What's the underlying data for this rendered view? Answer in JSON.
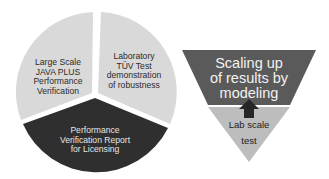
{
  "pie": {
    "segments": [
      {
        "label": "Laboratory TÜV Test demonstration of robustness",
        "lines": [
          "Laboratory",
          "TÜV Test",
          "demonstration",
          "of robustness"
        ],
        "color": "#d9d9d9"
      },
      {
        "label": "Performance Verification Report for Licensing",
        "lines": [
          "Performance",
          "Verification Report",
          "for Licensing"
        ],
        "color": "#2f2f2f"
      },
      {
        "label": "Large Scale JAVA PLUS Performance Verification",
        "lines": [
          "Large Scale",
          "JAVA PLUS",
          "Performance",
          "Verification"
        ],
        "color": "#d9d9d9"
      }
    ]
  },
  "funnel": {
    "top": {
      "lines": [
        "Scaling up",
        "of results by",
        "modeling"
      ],
      "color": "#5a5a5a"
    },
    "bottom": {
      "lines": [
        "Lab scale",
        "test"
      ],
      "color": "#bdbdbd"
    },
    "arrow": {
      "direction": "up",
      "color": "#262626"
    }
  }
}
